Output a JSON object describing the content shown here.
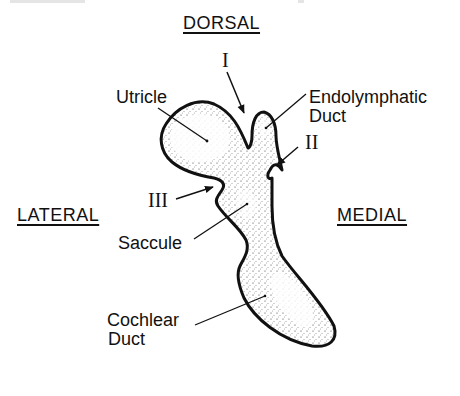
{
  "orientation": {
    "dorsal": "DORSAL",
    "lateral": "LATERAL",
    "medial": "MEDIAL"
  },
  "labels": {
    "utricle": "Utricle",
    "endolymphatic_duct_line1": "Endolymphatic",
    "endolymphatic_duct_line2": "Duct",
    "saccule": "Saccule",
    "cochlear_duct_line1": "Cochlear",
    "cochlear_duct_line2": "Duct"
  },
  "markers": {
    "I": "I",
    "II": "II",
    "III": "III"
  },
  "colors": {
    "outline": "#111111",
    "stipple": "#333333",
    "background": "#ffffff"
  }
}
